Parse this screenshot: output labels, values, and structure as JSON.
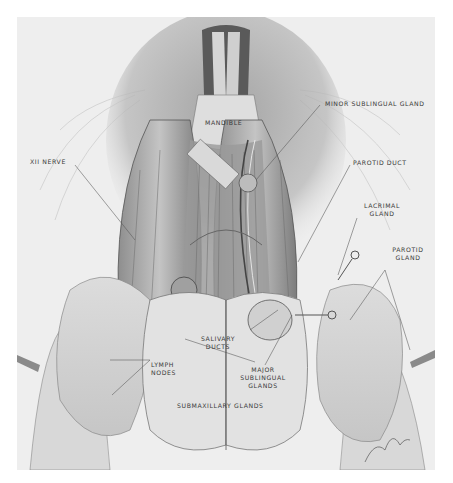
{
  "figure": {
    "type": "anatomical illustration",
    "style": "graphite pencil drawing",
    "background_color": "#eeeeee",
    "page_color": "#ffffff"
  },
  "labels": {
    "mandible": "MANDIBLE",
    "minor_sublingual_gland": "MINOR SUBLINGUAL GLAND",
    "xii_nerve": "XII NERVE",
    "parotid_duct": "PAROTID DUCT",
    "lacrimal_gland_line1": "LACRIMAL",
    "lacrimal_gland_line2": "GLAND",
    "parotid_gland_line1": "PAROTID",
    "parotid_gland_line2": "GLAND",
    "salivary_ducts_line1": "SALIVARY",
    "salivary_ducts_line2": "DUCTS",
    "lymph_nodes_line1": "LYMPH",
    "lymph_nodes_line2": "NODES",
    "major_sublingual_line1": "MAJOR",
    "major_sublingual_line2": "SUBLINGUAL",
    "major_sublingual_line3": "GLANDS",
    "submaxillary_glands": "SUBMAXILLARY GLANDS"
  },
  "signature": "artist signature (illegible)"
}
